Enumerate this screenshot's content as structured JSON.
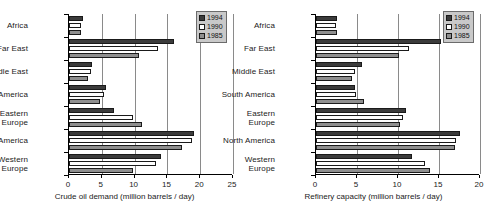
{
  "chart_data": [
    {
      "type": "bar",
      "orientation": "horizontal",
      "title": "",
      "xlabel": "Crude oil demand (million barrels / day)",
      "ylabel": "",
      "xlim": [
        0,
        25
      ],
      "xticks": [
        0,
        5,
        10,
        15,
        20,
        25
      ],
      "xtick_labels": [
        "0",
        "5",
        "10",
        "15",
        "20",
        "25"
      ],
      "grid": true,
      "legend_position": "top-right",
      "categories": [
        "Africa",
        "Far East",
        "Middle East",
        "South America",
        "Eastern\nEurope",
        "North America",
        "Western\nEurope"
      ],
      "series": [
        {
          "name": "1994",
          "color": "#3b3b3b",
          "values": [
            2.2,
            16.0,
            3.5,
            5.7,
            6.9,
            19.1,
            14.0
          ]
        },
        {
          "name": "1990",
          "color": "#ffffff",
          "values": [
            1.8,
            13.5,
            3.4,
            5.3,
            9.7,
            18.7,
            13.2
          ]
        },
        {
          "name": "1985",
          "color": "#8f8f8f",
          "values": [
            1.9,
            10.7,
            2.9,
            4.7,
            11.2,
            17.2,
            9.7
          ]
        }
      ]
    },
    {
      "type": "bar",
      "orientation": "horizontal",
      "title": "",
      "xlabel": "Refinery capacity (million barrels / day)",
      "ylabel": "",
      "xlim": [
        0,
        20
      ],
      "xticks": [
        0,
        5,
        10,
        15,
        20
      ],
      "xtick_labels": [
        "0",
        "5",
        "10",
        "15",
        "20"
      ],
      "grid": true,
      "legend_position": "top-right",
      "categories": [
        "Africa",
        "Far East",
        "Middle East",
        "South America",
        "Eastern\nEurope",
        "North America",
        "Western\nEurope"
      ],
      "series": [
        {
          "name": "1994",
          "color": "#3b3b3b",
          "values": [
            2.6,
            15.3,
            5.6,
            4.7,
            11.0,
            17.6,
            11.7
          ]
        },
        {
          "name": "1990",
          "color": "#ffffff",
          "values": [
            2.4,
            11.4,
            4.8,
            4.9,
            10.6,
            17.1,
            13.3
          ]
        },
        {
          "name": "1985",
          "color": "#8f8f8f",
          "values": [
            2.5,
            10.1,
            4.4,
            5.8,
            10.3,
            17.0,
            13.9
          ]
        }
      ]
    }
  ],
  "panels": [
    {
      "axis_title": "Crude oil demand (million barrels / day)",
      "legend": [
        {
          "label": "1994"
        },
        {
          "label": "1990"
        },
        {
          "label": "1985"
        }
      ]
    },
    {
      "axis_title": "Refinery capacity (million barrels / day)",
      "legend": [
        {
          "label": "1994"
        },
        {
          "label": "1990"
        },
        {
          "label": "1985"
        }
      ]
    }
  ]
}
